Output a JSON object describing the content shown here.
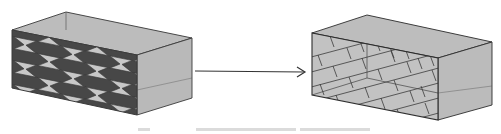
{
  "figure": {
    "left_box": {
      "pattern": "hexagon-tiling",
      "face_color": "#bdbdbd",
      "edge_color": "#3a3a3a",
      "tile_fill_color": "#4a4a4a",
      "gap_color": "#c9c9c9"
    },
    "arrow": {
      "direction": "right",
      "color": "#333333"
    },
    "right_box": {
      "pattern": "brick-tiling",
      "face_color": "#bdbdbd",
      "edge_color": "#2e2e2e",
      "tile_fill_color": "#c0c0c0",
      "tile_line_color": "#333333"
    }
  },
  "caption": {
    "text": ""
  }
}
